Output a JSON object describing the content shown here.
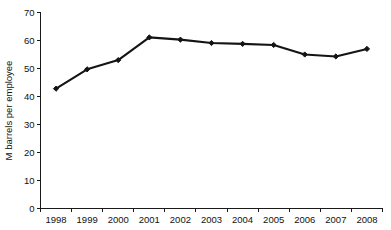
{
  "chart_data": {
    "type": "line",
    "title": "",
    "xlabel": "",
    "ylabel": "M barrels per employee",
    "categories": [
      "1998",
      "1999",
      "2000",
      "2001",
      "2002",
      "2003",
      "2004",
      "2005",
      "2006",
      "2007",
      "2008"
    ],
    "values": [
      42.8,
      49.7,
      53.0,
      61.1,
      60.3,
      59.1,
      58.8,
      58.4,
      55.0,
      54.3,
      57.0
    ],
    "series": [
      {
        "name": "M barrels per employee",
        "values": [
          42.8,
          49.7,
          53.0,
          61.1,
          60.3,
          59.1,
          58.8,
          58.4,
          55.0,
          54.3,
          57.0
        ]
      }
    ],
    "ylim": [
      0,
      70
    ],
    "y_ticks": [
      0,
      10,
      20,
      30,
      40,
      50,
      60,
      70
    ],
    "y_tick_labels": [
      "0",
      "10",
      "20",
      "30",
      "40",
      "50",
      "60",
      "70"
    ],
    "x_tick_labels": [
      "1998",
      "1999",
      "2000",
      "2001",
      "2002",
      "2003",
      "2004",
      "2005",
      "2006",
      "2007",
      "2008"
    ],
    "grid": false,
    "legend": false,
    "legend_position": "none",
    "marker": "diamond",
    "line_color": "#141414",
    "marker_color": "#141414",
    "axis_color": "#1a1a1a",
    "background_color": "#ffffff"
  }
}
